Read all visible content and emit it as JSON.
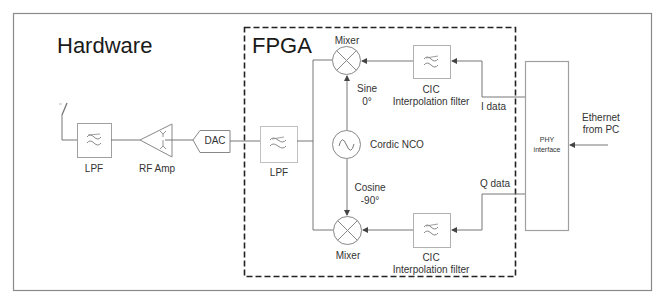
{
  "diagram": {
    "sections": {
      "hardware_label": "Hardware",
      "fpga_label": "FPGA"
    },
    "blocks": {
      "antenna": {
        "icon": "antenna-icon"
      },
      "hw_lpf": {
        "label": "LPF",
        "icon": "lowpass-filter-icon"
      },
      "rf_amp": {
        "label": "RF Amp",
        "icon": "amplifier-icon"
      },
      "dac": {
        "label": "DAC"
      },
      "fpga_lpf": {
        "label": "LPF",
        "icon": "lowpass-filter-icon"
      },
      "mixer_top": {
        "label": "Mixer",
        "icon": "mixer-icon"
      },
      "mixer_bottom": {
        "label": "Mixer",
        "icon": "mixer-icon"
      },
      "nco": {
        "label": "Cordic NCO",
        "icon": "sine-oscillator-icon"
      },
      "cic_top": {
        "label_line1": "CIC",
        "label_line2": "Interpolation filter",
        "icon": "filter-icon"
      },
      "cic_bottom": {
        "label_line1": "CIC",
        "label_line2": "Interpolation filter",
        "icon": "filter-icon"
      },
      "phy": {
        "label_line1": "PHY",
        "label_line2": "interface"
      }
    },
    "signals": {
      "sine_line1": "Sine",
      "sine_line2": "0°",
      "cosine_line1": "Cosine",
      "cosine_line2": "-90°",
      "i_data": "I data",
      "q_data": "Q data",
      "ethernet_line1": "Ethernet",
      "ethernet_line2": "from PC"
    },
    "colors": {
      "line": "#6e6e6e",
      "block_border": "#a0a0a0",
      "dashed_border": "#222222",
      "text": "#333333"
    }
  }
}
